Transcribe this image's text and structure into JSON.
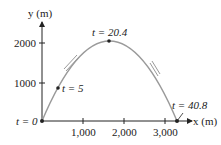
{
  "diagram": {
    "type": "projectile-trajectory",
    "y_axis_label": "y (m)",
    "x_axis_label": "x (m)",
    "y_ticks": [
      "1000",
      "2000"
    ],
    "x_ticks": [
      "1,000",
      "2,000",
      "3,000"
    ],
    "points": [
      {
        "label": "t = 0",
        "x": 0,
        "y": 0
      },
      {
        "label": "t = 5",
        "x": 400,
        "y": 900
      },
      {
        "label": "t = 20.4",
        "x": 1650,
        "y": 2040
      },
      {
        "label": "t = 40.8",
        "x": 3300,
        "y": 0
      }
    ],
    "colors": {
      "curve": "#9a9a9a",
      "axes": "#222222",
      "arrows": "#9a9a9a"
    }
  }
}
